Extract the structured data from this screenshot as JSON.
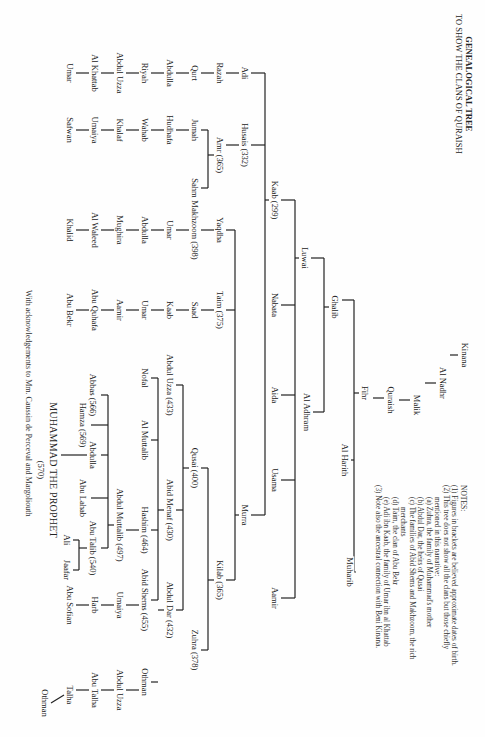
{
  "title": {
    "line1": "GENEALOGICAL TREE",
    "line2": "TO SHOW THE CLANS OF QURAISH"
  },
  "notes": {
    "heading": "NOTES:",
    "items": [
      "(1) Figures in brackets are believed approximate dates of birth.",
      "(2) This tree does not show all the clans but those chiefly",
      "mentioned in this narrative:",
      "(a) Zuhra, the family of Muhammad's mother",
      "(b) Abdul Dar, the heirs of Qusai",
      "(c) The families of Abid Shems and Makhzoom, the rich",
      "merchants",
      "(d) Taim, the clan of Abu Bekr",
      "(e) Adi ibn Kaab, the family of Umar ibn al Khattab",
      "(3) Note also the ancestral connection with Beni Kinana."
    ]
  },
  "acknowledgement": "With acknowledgements to Mm. Caussin de Perceval and Margoliouth",
  "people": [
    {
      "id": "kinana",
      "name": "Kinana",
      "x": 355,
      "y": 20
    },
    {
      "id": "al_nadhr",
      "name": "Al Nadhr",
      "x": 383,
      "y": 42
    },
    {
      "id": "malik",
      "name": "Malik",
      "x": 405,
      "y": 68
    },
    {
      "id": "quraish",
      "name": "Quraish",
      "x": 400,
      "y": 94
    },
    {
      "id": "fihr",
      "name": "Fihr",
      "x": 393,
      "y": 120
    },
    {
      "id": "muharib",
      "name": "Muharib",
      "x": 572,
      "y": 135
    },
    {
      "id": "al_harith",
      "name": "Al Harith",
      "x": 460,
      "y": 140
    },
    {
      "id": "ghalib",
      "name": "Ghalib",
      "x": 307,
      "y": 150
    },
    {
      "id": "luwai",
      "name": "Luwai",
      "x": 258,
      "y": 180
    },
    {
      "id": "al_adhram",
      "name": "Al Adhram",
      "x": 412,
      "y": 178
    },
    {
      "id": "kaab",
      "name": "Kaab (299)",
      "x": 200,
      "y": 210
    },
    {
      "id": "nabata",
      "name": "Nabata",
      "x": 305,
      "y": 210
    },
    {
      "id": "aida",
      "name": "Aida",
      "x": 395,
      "y": 210
    },
    {
      "id": "usama",
      "name": "Usama",
      "x": 480,
      "y": 210
    },
    {
      "id": "aamir_l",
      "name": "Aamir",
      "x": 598,
      "y": 210
    },
    {
      "id": "adi",
      "name": "Adi",
      "x": 73,
      "y": 240
    },
    {
      "id": "husais",
      "name": "Husais (332)",
      "x": 145,
      "y": 240
    },
    {
      "id": "murra",
      "name": "Murra",
      "x": 515,
      "y": 240
    },
    {
      "id": "razah",
      "name": "Razah",
      "x": 73,
      "y": 265
    },
    {
      "id": "amr",
      "name": "Amr (365)",
      "x": 155,
      "y": 265
    },
    {
      "id": "yaqdha",
      "name": "Yaqdha",
      "x": 230,
      "y": 265
    },
    {
      "id": "taim",
      "name": "Taim (375)",
      "x": 310,
      "y": 265
    },
    {
      "id": "kilab",
      "name": "Kilab (365)",
      "x": 580,
      "y": 265
    },
    {
      "id": "qurt",
      "name": "Qurt",
      "x": 73,
      "y": 290
    },
    {
      "id": "jumah",
      "name": "Jumah",
      "x": 130,
      "y": 290
    },
    {
      "id": "sahm",
      "name": "Sahm",
      "x": 188,
      "y": 290
    },
    {
      "id": "makhzoom",
      "name": "Makhzoom (398)",
      "x": 230,
      "y": 290
    },
    {
      "id": "saad",
      "name": "Saad",
      "x": 310,
      "y": 290
    },
    {
      "id": "qusai",
      "name": "Qusai (400)",
      "x": 468,
      "y": 290
    },
    {
      "id": "abdulla_adi",
      "name": "Abdulla",
      "x": 73,
      "y": 315
    },
    {
      "id": "hudhafa",
      "name": "Hudhafa",
      "x": 130,
      "y": 315
    },
    {
      "id": "umar_m",
      "name": "Umar",
      "x": 230,
      "y": 315
    },
    {
      "id": "kaab_t",
      "name": "Kaab",
      "x": 310,
      "y": 315
    },
    {
      "id": "abdul_uzza_433",
      "name": "Abdul Uzza (433)",
      "x": 385,
      "y": 315
    },
    {
      "id": "abid_menaf",
      "name": "Abid Menaf (430)",
      "x": 510,
      "y": 315
    },
    {
      "id": "abdul_dar",
      "name": "Abdul Dar (432)",
      "x": 610,
      "y": 315
    },
    {
      "id": "zuhra",
      "name": "Zuhra (378)",
      "x": 650,
      "y": 290
    },
    {
      "id": "riyah",
      "name": "Riyah",
      "x": 73,
      "y": 340
    },
    {
      "id": "wahab",
      "name": "Wahab",
      "x": 130,
      "y": 340
    },
    {
      "id": "abdulla_m",
      "name": "Abdulla",
      "x": 230,
      "y": 340
    },
    {
      "id": "umar_t",
      "name": "Umar",
      "x": 310,
      "y": 340
    },
    {
      "id": "nofal",
      "name": "Nofal",
      "x": 378,
      "y": 340
    },
    {
      "id": "al_muttalib",
      "name": "Al Muttalib",
      "x": 440,
      "y": 340
    },
    {
      "id": "hashim",
      "name": "Hashim (464)",
      "x": 530,
      "y": 340
    },
    {
      "id": "abid_shems",
      "name": "Abid Shems (455)",
      "x": 600,
      "y": 340
    },
    {
      "id": "othman_d",
      "name": "Othman",
      "x": 682,
      "y": 340
    },
    {
      "id": "abdul_uzza_a",
      "name": "Abdul Uzza",
      "x": 73,
      "y": 365
    },
    {
      "id": "khalaf",
      "name": "Khalaf",
      "x": 130,
      "y": 365
    },
    {
      "id": "mughira",
      "name": "Mughira",
      "x": 230,
      "y": 365
    },
    {
      "id": "aamir_t",
      "name": "Aamir",
      "x": 310,
      "y": 365
    },
    {
      "id": "abdul_muttalib",
      "name": "Abdul Muttalib (497)",
      "x": 525,
      "y": 365
    },
    {
      "id": "umaiya_s",
      "name": "Umaiya",
      "x": 605,
      "y": 365
    },
    {
      "id": "abdul_uzza_d",
      "name": "Abdul Uzza",
      "x": 690,
      "y": 365
    },
    {
      "id": "al_khattab",
      "name": "Al Khattab",
      "x": 73,
      "y": 390
    },
    {
      "id": "umaiya_j",
      "name": "Umaiya",
      "x": 130,
      "y": 390
    },
    {
      "id": "al_waleed",
      "name": "Al Waleed",
      "x": 230,
      "y": 390
    },
    {
      "id": "abu_quhafa",
      "name": "Abu Quhafa",
      "x": 310,
      "y": 390
    },
    {
      "id": "abbas",
      "name": "Abbas (566)",
      "x": 395,
      "y": 392
    },
    {
      "id": "hamza",
      "name": "Hamza (569)",
      "x": 425,
      "y": 402
    },
    {
      "id": "abdulla_p",
      "name": "Abdulla",
      "x": 455,
      "y": 392
    },
    {
      "id": "abu_lahab",
      "name": "Abu Lahab",
      "x": 498,
      "y": 402
    },
    {
      "id": "abu_talib",
      "name": "Abu Talib (540)",
      "x": 548,
      "y": 392
    },
    {
      "id": "harb",
      "name": "Harb",
      "x": 605,
      "y": 390
    },
    {
      "id": "abu_talha",
      "name": "Abu Talha",
      "x": 690,
      "y": 390
    },
    {
      "id": "umar_k",
      "name": "Umar",
      "x": 73,
      "y": 415
    },
    {
      "id": "safwan",
      "name": "Safwan",
      "x": 130,
      "y": 415
    },
    {
      "id": "khalid",
      "name": "Khalid",
      "x": 230,
      "y": 415
    },
    {
      "id": "abu_bekr",
      "name": "Abu Bekr",
      "x": 310,
      "y": 415
    },
    {
      "id": "muhammad",
      "name": "MUHAMMAD THE PROPHET",
      "x": 470,
      "y": 432
    },
    {
      "id": "muhammad_date",
      "name": "(570)",
      "x": 470,
      "y": 444
    },
    {
      "id": "ali",
      "name": "Ali",
      "x": 540,
      "y": 418
    },
    {
      "id": "jaafar",
      "name": "Jaafar",
      "x": 570,
      "y": 418
    },
    {
      "id": "abu_sofian",
      "name": "Abu Sofian",
      "x": 605,
      "y": 415
    },
    {
      "id": "talha",
      "name": "Talha",
      "x": 695,
      "y": 415
    },
    {
      "id": "othman_t",
      "name": "Othman",
      "x": 703,
      "y": 440
    }
  ],
  "lines": [
    [
      355,
      27,
      355,
      35
    ],
    [
      383,
      49,
      383,
      60
    ],
    [
      400,
      75,
      400,
      86
    ],
    [
      398,
      101,
      398,
      112
    ],
    [
      393,
      126,
      393,
      131
    ],
    [
      300,
      131,
      572,
      131
    ],
    [
      300,
      131,
      300,
      143
    ],
    [
      460,
      131,
      460,
      134
    ],
    [
      572,
      131,
      572,
      129
    ],
    [
      307,
      156,
      307,
      161
    ],
    [
      258,
      161,
      412,
      161
    ],
    [
      258,
      161,
      258,
      174
    ],
    [
      412,
      161,
      412,
      172
    ],
    [
      258,
      186,
      258,
      190
    ],
    [
      200,
      190,
      598,
      190
    ],
    [
      200,
      190,
      200,
      204
    ],
    [
      305,
      190,
      305,
      204
    ],
    [
      395,
      190,
      395,
      204
    ],
    [
      480,
      190,
      480,
      204
    ],
    [
      598,
      190,
      598,
      204
    ],
    [
      200,
      216,
      200,
      220
    ],
    [
      73,
      220,
      515,
      220
    ],
    [
      73,
      220,
      73,
      234
    ],
    [
      145,
      220,
      145,
      234
    ],
    [
      515,
      220,
      515,
      234
    ],
    [
      73,
      246,
      73,
      259
    ],
    [
      145,
      246,
      145,
      259
    ],
    [
      515,
      246,
      515,
      250
    ],
    [
      230,
      250,
      580,
      250
    ],
    [
      230,
      250,
      230,
      259
    ],
    [
      310,
      250,
      310,
      259
    ],
    [
      580,
      250,
      580,
      259
    ],
    [
      73,
      271,
      73,
      284
    ],
    [
      155,
      271,
      155,
      277
    ],
    [
      130,
      277,
      188,
      277
    ],
    [
      130,
      277,
      130,
      284
    ],
    [
      188,
      277,
      188,
      284
    ],
    [
      230,
      271,
      230,
      284
    ],
    [
      310,
      271,
      310,
      284
    ],
    [
      580,
      271,
      580,
      277
    ],
    [
      468,
      277,
      650,
      277
    ],
    [
      468,
      277,
      468,
      284
    ],
    [
      650,
      277,
      650,
      284
    ],
    [
      73,
      296,
      73,
      309
    ],
    [
      130,
      296,
      130,
      309
    ],
    [
      230,
      296,
      230,
      309
    ],
    [
      310,
      296,
      310,
      309
    ],
    [
      468,
      296,
      468,
      302
    ],
    [
      385,
      302,
      610,
      302
    ],
    [
      385,
      302,
      385,
      309
    ],
    [
      510,
      302,
      510,
      309
    ],
    [
      610,
      302,
      610,
      309
    ],
    [
      73,
      321,
      73,
      334
    ],
    [
      130,
      321,
      130,
      334
    ],
    [
      230,
      321,
      230,
      334
    ],
    [
      310,
      321,
      310,
      334
    ],
    [
      510,
      321,
      510,
      327
    ],
    [
      378,
      327,
      600,
      327
    ],
    [
      378,
      327,
      378,
      334
    ],
    [
      440,
      327,
      440,
      334
    ],
    [
      530,
      327,
      530,
      334
    ],
    [
      600,
      327,
      600,
      334
    ],
    [
      610,
      321,
      610,
      327
    ],
    [
      682,
      327,
      682,
      334
    ],
    [
      73,
      346,
      73,
      359
    ],
    [
      130,
      346,
      130,
      359
    ],
    [
      230,
      346,
      230,
      359
    ],
    [
      310,
      346,
      310,
      359
    ],
    [
      530,
      346,
      530,
      359
    ],
    [
      605,
      346,
      605,
      359
    ],
    [
      690,
      346,
      690,
      359
    ],
    [
      73,
      371,
      73,
      384
    ],
    [
      130,
      371,
      130,
      384
    ],
    [
      230,
      371,
      230,
      384
    ],
    [
      310,
      371,
      310,
      384
    ],
    [
      525,
      371,
      525,
      377
    ],
    [
      395,
      377,
      548,
      377
    ],
    [
      395,
      377,
      395,
      384
    ],
    [
      425,
      377,
      425,
      394
    ],
    [
      455,
      377,
      455,
      384
    ],
    [
      498,
      377,
      498,
      394
    ],
    [
      548,
      377,
      548,
      384
    ],
    [
      605,
      371,
      605,
      384
    ],
    [
      690,
      371,
      690,
      384
    ],
    [
      73,
      396,
      73,
      409
    ],
    [
      130,
      396,
      130,
      409
    ],
    [
      230,
      396,
      230,
      409
    ],
    [
      310,
      396,
      310,
      409
    ],
    [
      455,
      398,
      455,
      424
    ],
    [
      548,
      398,
      548,
      406
    ],
    [
      540,
      406,
      570,
      406
    ],
    [
      540,
      406,
      540,
      412
    ],
    [
      570,
      406,
      570,
      412
    ],
    [
      605,
      396,
      605,
      409
    ],
    [
      690,
      396,
      690,
      409
    ],
    [
      695,
      421,
      703,
      434
    ]
  ]
}
